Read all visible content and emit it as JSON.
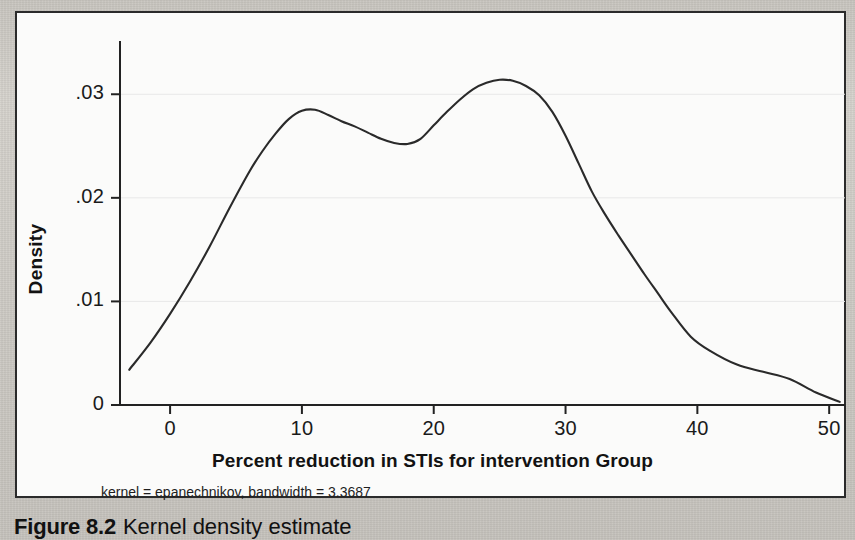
{
  "figure": {
    "caption_label": "Figure 8.2",
    "caption_text": "Kernel density estimate"
  },
  "chart_data": {
    "type": "line",
    "title": "",
    "subtitle": "kernel = epanechnikov, bandwidth = 3.3687",
    "xlabel": "Percent reduction in STIs for intervention Group",
    "ylabel": "Density",
    "xlim": [
      -3.8,
      51.2
    ],
    "ylim": [
      0,
      0.0335
    ],
    "xticks": [
      0,
      10,
      20,
      30,
      40,
      50
    ],
    "xtick_labels": [
      "0",
      "10",
      "20",
      "30",
      "40",
      "50"
    ],
    "yticks": [
      0,
      0.01,
      0.02,
      0.03
    ],
    "ytick_labels": [
      "0",
      ".01",
      ".02",
      ".03"
    ],
    "grid": "horizontal",
    "grid_color": "#e8e8e8",
    "line_color": "#2a2a2a",
    "line_width": 2.1,
    "x": [
      -3.1,
      -1.5,
      0.0,
      1.5,
      3.0,
      4.5,
      6.0,
      7.0,
      8.0,
      9.0,
      10.0,
      11.0,
      12.0,
      13.0,
      14.0,
      15.0,
      16.0,
      17.0,
      18.0,
      19.0,
      20.0,
      21.0,
      22.0,
      23.0,
      24.0,
      25.0,
      26.0,
      27.0,
      28.0,
      29.0,
      30.0,
      31.0,
      32.0,
      33.0,
      34.0,
      35.0,
      36.0,
      37.0,
      38.0,
      39.5,
      41.0,
      43.0,
      45.0,
      47.0,
      49.0,
      50.8
    ],
    "y": [
      0.0034,
      0.006,
      0.0088,
      0.0119,
      0.0153,
      0.019,
      0.0225,
      0.0245,
      0.0262,
      0.0276,
      0.0284,
      0.0285,
      0.028,
      0.0274,
      0.0269,
      0.0263,
      0.0257,
      0.0253,
      0.0252,
      0.0257,
      0.027,
      0.0283,
      0.0295,
      0.0305,
      0.0311,
      0.0314,
      0.0313,
      0.0308,
      0.0299,
      0.0283,
      0.026,
      0.0233,
      0.0206,
      0.0184,
      0.0164,
      0.0145,
      0.0126,
      0.0108,
      0.009,
      0.0066,
      0.0052,
      0.0039,
      0.0032,
      0.0025,
      0.0012,
      0.0003
    ]
  }
}
